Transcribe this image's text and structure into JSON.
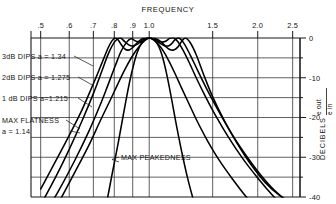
{
  "chart_data": {
    "type": "line",
    "title": "FREQUENCY",
    "xlabel": "FREQUENCY",
    "ylabel": "DECIBELS",
    "ylabel_fraction_num": "e out",
    "ylabel_fraction_den": "e in",
    "xscale": "log",
    "xlim": [
      0.47,
      2.62
    ],
    "ylim": [
      -40,
      0
    ],
    "grid": true,
    "legend": "none",
    "xtick_labels": [
      ".5",
      ".6",
      ".7",
      ".8",
      ".9",
      "1.0",
      "1.5",
      "2.0",
      "2.5"
    ],
    "xtick_values": [
      0.5,
      0.6,
      0.7,
      0.8,
      0.9,
      1.0,
      1.5,
      2.0,
      2.5
    ],
    "ytick_labels": [
      "0",
      "-10",
      "-20",
      "-30",
      "-40"
    ],
    "ytick_values": [
      0,
      -10,
      -20,
      -30,
      -40
    ],
    "yminor_values": [
      -5,
      -15,
      -25,
      -35
    ],
    "annotations": [
      {
        "id": "ripple3",
        "text": "3dB DIPS  a = 1.34"
      },
      {
        "id": "ripple2",
        "text": "2dB DIPS  a = 1.275"
      },
      {
        "id": "ripple1",
        "text": "1 dB DIPS  a=1.215"
      },
      {
        "id": "flat1",
        "text": "MAX FLATNESS"
      },
      {
        "id": "flat2",
        "text": "a = 1.14"
      },
      {
        "id": "peak",
        "text": "MAX PEAKEDNESS"
      }
    ],
    "series": [
      {
        "name": "3dB DIPS a = 1.34",
        "ripple_db": 3,
        "a": 1.34,
        "x": [
          0.5,
          0.55,
          0.6,
          0.65,
          0.7,
          0.74,
          0.77,
          0.79,
          0.805,
          0.82,
          0.84,
          0.86,
          0.88,
          0.9,
          0.93,
          0.96,
          1.0,
          1.04,
          1.08,
          1.11,
          1.14,
          1.17,
          1.2,
          1.23,
          1.26,
          1.3,
          1.35,
          1.42,
          1.5,
          1.62,
          1.75,
          1.9,
          2.1,
          2.3,
          2.5
        ],
        "y": [
          -38.0,
          -31.0,
          -24.5,
          -18.2,
          -11.5,
          -6.2,
          -2.4,
          -0.6,
          0.0,
          -0.5,
          -1.9,
          -2.9,
          -3.0,
          -2.4,
          -1.0,
          -0.1,
          0.2,
          -0.1,
          -1.0,
          -2.1,
          -2.9,
          -3.0,
          -2.3,
          -0.9,
          0.0,
          -1.2,
          -4.2,
          -9.5,
          -14.8,
          -21.0,
          -26.4,
          -31.4,
          -36.4,
          -39.6,
          -41.5
        ]
      },
      {
        "name": "2dB DIPS a = 1.275",
        "ripple_db": 2,
        "a": 1.275,
        "x": [
          0.5,
          0.55,
          0.6,
          0.65,
          0.7,
          0.74,
          0.77,
          0.8,
          0.83,
          0.855,
          0.88,
          0.9,
          0.93,
          0.96,
          1.0,
          1.04,
          1.07,
          1.1,
          1.13,
          1.155,
          1.18,
          1.21,
          1.25,
          1.3,
          1.36,
          1.44,
          1.54,
          1.66,
          1.8,
          1.98,
          2.18,
          2.4,
          2.5
        ],
        "y": [
          -42.0,
          -35.0,
          -28.0,
          -21.0,
          -14.0,
          -8.2,
          -4.0,
          -1.1,
          0.0,
          -0.9,
          -1.8,
          -2.0,
          -1.5,
          -0.4,
          0.2,
          -0.4,
          -1.3,
          -1.9,
          -2.0,
          -1.4,
          -0.4,
          0.0,
          -1.4,
          -4.3,
          -8.0,
          -12.6,
          -17.6,
          -22.8,
          -27.8,
          -33.0,
          -37.5,
          -41.0,
          -42.5
        ]
      },
      {
        "name": "1 dB DIPS a=1.215",
        "ripple_db": 1,
        "a": 1.215,
        "x": [
          0.5,
          0.56,
          0.62,
          0.68,
          0.73,
          0.77,
          0.805,
          0.835,
          0.865,
          0.89,
          0.92,
          0.95,
          1.0,
          1.05,
          1.08,
          1.11,
          1.14,
          1.17,
          1.2,
          1.24,
          1.29,
          1.35,
          1.43,
          1.53,
          1.66,
          1.82,
          2.0,
          2.22,
          2.45,
          2.5
        ],
        "y": [
          -46.0,
          -38.5,
          -31.0,
          -23.5,
          -17.0,
          -11.6,
          -7.0,
          -3.4,
          -1.1,
          -0.2,
          -0.8,
          -1.0,
          0.0,
          -0.7,
          -1.0,
          -0.8,
          -0.1,
          0.0,
          -0.9,
          -3.0,
          -6.1,
          -10.0,
          -14.6,
          -19.6,
          -25.0,
          -30.4,
          -35.2,
          -40.0,
          -44.0,
          -44.8
        ]
      },
      {
        "name": "MAX FLATNESS a = 1.14",
        "ripple_db": 0,
        "a": 1.14,
        "x": [
          0.5,
          0.56,
          0.62,
          0.68,
          0.73,
          0.78,
          0.82,
          0.86,
          0.9,
          0.94,
          0.97,
          1.0,
          1.03,
          1.06,
          1.1,
          1.14,
          1.18,
          1.23,
          1.29,
          1.36,
          1.45,
          1.56,
          1.7,
          1.86,
          2.05,
          2.26,
          2.5
        ],
        "y": [
          -49.0,
          -41.5,
          -34.0,
          -27.0,
          -21.0,
          -15.6,
          -11.4,
          -7.6,
          -4.4,
          -2.0,
          -0.7,
          0.0,
          -0.5,
          -1.6,
          -3.6,
          -6.2,
          -9.0,
          -12.6,
          -16.6,
          -21.0,
          -25.8,
          -30.6,
          -35.4,
          -40.0,
          -44.2,
          -48.0,
          -51.0
        ]
      },
      {
        "name": "MAX PEAKEDNESS",
        "ripple_db": null,
        "a": null,
        "x": [
          0.76,
          0.79,
          0.82,
          0.845,
          0.865,
          0.885,
          0.905,
          0.925,
          0.95,
          0.975,
          1.0,
          1.025,
          1.05,
          1.075,
          1.095,
          1.115,
          1.135,
          1.16,
          1.19,
          1.23,
          1.28,
          1.34,
          1.41
        ],
        "y": [
          -42.0,
          -34.0,
          -26.5,
          -20.0,
          -15.0,
          -10.5,
          -6.8,
          -3.8,
          -1.5,
          -0.3,
          0.0,
          -0.3,
          -1.3,
          -3.2,
          -5.6,
          -8.6,
          -12.0,
          -16.5,
          -22.0,
          -28.5,
          -35.5,
          -42.0,
          -47.0
        ]
      }
    ]
  }
}
